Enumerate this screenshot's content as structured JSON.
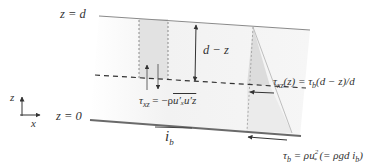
{
  "diagram": {
    "type": "open-channel shear stress distribution",
    "labels": {
      "top_surface": "z = d",
      "bed": "z = 0",
      "depth_arrow": "d − z",
      "reynolds_stress": "τ_xz = −ρ u'_x u'_z",
      "reynolds_stress_lhs": "τ",
      "reynolds_stress_lhs_sub": "xz",
      "reynolds_stress_rhs": " = −ρ",
      "reynolds_stress_overline": "u′ₓu′z",
      "linear_profile": "τxz(z) = τb(d − z)/d",
      "linear_profile_lhs": "τ",
      "linear_profile_lhs_sub": "xz",
      "linear_profile_rhs": "(z) = τ",
      "linear_profile_rhs_sub": "b",
      "linear_profile_tail": "(d − z)/d",
      "bed_stress_tau": "τ",
      "bed_stress_sub": "b",
      "bed_stress_rhs": " = ρu",
      "bed_stress_sup": "2",
      "bed_stress_star": "*",
      "bed_stress_paren": " (= ρgd i",
      "bed_stress_paren_sub": "b",
      "bed_stress_close": ")",
      "slope": "i",
      "slope_sub": "b",
      "axis_z": "z",
      "axis_x": "x"
    },
    "colors": {
      "line": "#8a8a8a",
      "bed_line": "#6a6a6a",
      "shade": "#e4e4e4",
      "background_shade": "#f3f3f3",
      "arrow": "#333333"
    }
  }
}
